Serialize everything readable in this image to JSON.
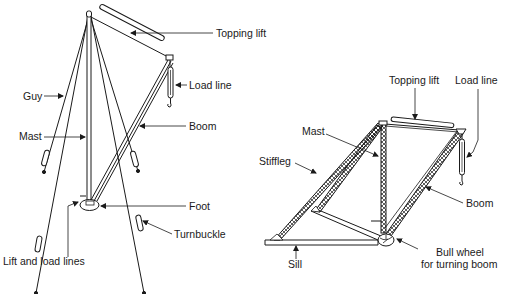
{
  "diagram": {
    "left_derrick": {
      "name": "Guy derrick",
      "labels": {
        "topping_lift": "Topping lift",
        "load_line": "Load line",
        "guy": "Guy",
        "mast": "Mast",
        "boom": "Boom",
        "foot": "Foot",
        "turnbuckle": "Turnbuckle",
        "lift_and_load_lines": "Lift and load lines"
      }
    },
    "right_derrick": {
      "name": "Stiffleg derrick",
      "labels": {
        "topping_lift": "Topping lift",
        "load_line": "Load line",
        "mast": "Mast",
        "stiffleg": "Stiffleg",
        "boom": "Boom",
        "sill": "Sill",
        "bull_wheel_line1": "Bull wheel",
        "bull_wheel_line2": "for turning boom"
      }
    },
    "colors": {
      "ink": "#1a1a1a",
      "background": "#ffffff"
    }
  }
}
